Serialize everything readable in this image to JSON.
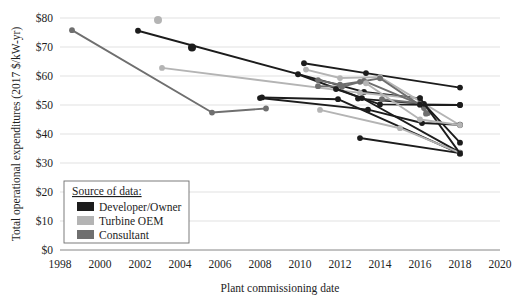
{
  "chart_data": {
    "type": "line",
    "title": "",
    "xlabel": "Plant commissioning date",
    "ylabel": "Total operational expenditures (2017 $/kW-yr)",
    "xlim": [
      1998,
      2020
    ],
    "ylim": [
      0,
      80
    ],
    "xticks": [
      "1998",
      "2000",
      "2002",
      "2004",
      "2006",
      "2008",
      "2010",
      "2012",
      "2014",
      "2016",
      "2018",
      "2020"
    ],
    "xtick_values": [
      1998,
      2000,
      2002,
      2004,
      2006,
      2008,
      2010,
      2012,
      2014,
      2016,
      2018,
      2020
    ],
    "yticks": [
      "$0",
      "$10",
      "$20",
      "$30",
      "$40",
      "$50",
      "$60",
      "$70",
      "$80"
    ],
    "ytick_values": [
      0,
      10,
      20,
      30,
      40,
      50,
      60,
      70,
      80
    ],
    "grid": true,
    "legend_position": "inside-lower-left",
    "legend_title": "Source of data:",
    "legend_entries": [
      {
        "name": "Developer/Owner",
        "color": "#1c1c1c"
      },
      {
        "name": "Turbine OEM",
        "color": "#b4b4b4"
      },
      {
        "name": "Consultant",
        "color": "#6f6f6f"
      }
    ],
    "series": [
      {
        "name": "Consultant A",
        "source": "Consultant",
        "color": "#6f6f6f",
        "points": [
          [
            1998.6,
            75.8
          ],
          [
            2005.6,
            47.4
          ],
          [
            2008.3,
            48.8
          ]
        ]
      },
      {
        "name": "Developer B",
        "source": "Developer/Owner",
        "color": "#1c1c1c",
        "points": [
          [
            2001.9,
            75.6
          ],
          [
            2013.2,
            54.5
          ],
          [
            2016.0,
            52.3
          ]
        ]
      },
      {
        "name": "Turbine OEM C",
        "source": "Turbine OEM",
        "color": "#b4b4b4",
        "points": [
          [
            2002.9,
            79.3
          ]
        ]
      },
      {
        "name": "Developer D",
        "source": "Developer/Owner",
        "color": "#1c1c1c",
        "points": [
          [
            2004.6,
            69.8
          ]
        ]
      },
      {
        "name": "Turbine OEM E",
        "source": "Turbine OEM",
        "color": "#b4b4b4",
        "points": [
          [
            2003.1,
            62.8
          ],
          [
            2013.0,
            54.2
          ],
          [
            2016.0,
            52.1
          ]
        ]
      },
      {
        "name": "Developer F",
        "source": "Developer/Owner",
        "color": "#1c1c1c",
        "points": [
          [
            2009.9,
            60.6
          ],
          [
            2013.1,
            52.4
          ],
          [
            2018.0,
            33.6
          ]
        ]
      },
      {
        "name": "Developer G",
        "source": "Developer/Owner",
        "color": "#1c1c1c",
        "points": [
          [
            2008.1,
            52.6
          ],
          [
            2011.9,
            52.0
          ],
          [
            2018.0,
            33.2
          ]
        ]
      },
      {
        "name": "Developer H",
        "source": "Developer/Owner",
        "color": "#1c1c1c",
        "points": [
          [
            2010.2,
            64.4
          ],
          [
            2013.3,
            61.0
          ],
          [
            2018.0,
            56.0
          ]
        ]
      },
      {
        "name": "Turbine OEM I",
        "source": "Turbine OEM",
        "color": "#b4b4b4",
        "points": [
          [
            2010.3,
            62.2
          ],
          [
            2012.0,
            59.3
          ],
          [
            2014.0,
            59.6
          ],
          [
            2018.0,
            43.0
          ]
        ]
      },
      {
        "name": "Consultant J",
        "source": "Consultant",
        "color": "#6f6f6f",
        "points": [
          [
            2010.9,
            58.6
          ],
          [
            2012.0,
            57.0
          ],
          [
            2013.0,
            58.0
          ],
          [
            2014.0,
            59.2
          ],
          [
            2016.2,
            49.0
          ]
        ]
      },
      {
        "name": "Consultant K",
        "source": "Consultant",
        "color": "#6f6f6f",
        "points": [
          [
            2010.9,
            56.5
          ],
          [
            2012.1,
            56.3
          ],
          [
            2013.2,
            58.3
          ],
          [
            2016.0,
            50.2
          ],
          [
            2016.4,
            47.2
          ]
        ]
      },
      {
        "name": "Developer L",
        "source": "Developer/Owner",
        "color": "#1c1c1c",
        "points": [
          [
            2011.8,
            55.5
          ],
          [
            2014.0,
            50.2
          ],
          [
            2018.0,
            50.0
          ]
        ]
      },
      {
        "name": "Developer M",
        "source": "Developer/Owner",
        "color": "#1c1c1c",
        "points": [
          [
            2012.9,
            52.2
          ],
          [
            2016.2,
            50.4
          ],
          [
            2018.0,
            37.0
          ]
        ]
      },
      {
        "name": "Developer N",
        "source": "Developer/Owner",
        "color": "#1c1c1c",
        "points": [
          [
            2013.0,
            38.6
          ],
          [
            2018.0,
            33.4
          ]
        ]
      },
      {
        "name": "Turbine OEM O",
        "source": "Turbine OEM",
        "color": "#b4b4b4",
        "points": [
          [
            2011.0,
            48.3
          ],
          [
            2015.0,
            42.0
          ],
          [
            2018.0,
            33.5
          ]
        ]
      },
      {
        "name": "Developer P",
        "source": "Developer/Owner",
        "color": "#1c1c1c",
        "points": [
          [
            2008.0,
            52.4
          ],
          [
            2013.4,
            48.4
          ],
          [
            2016.1,
            43.8
          ],
          [
            2018.0,
            43.2
          ]
        ]
      },
      {
        "name": "Consultant Q",
        "source": "Consultant",
        "color": "#6f6f6f",
        "points": [
          [
            2014.1,
            52.0
          ],
          [
            2016.0,
            50.6
          ],
          [
            2016.3,
            47.0
          ]
        ]
      },
      {
        "name": "Developer R",
        "source": "Developer/Owner",
        "color": "#1c1c1c",
        "points": [
          [
            2016.0,
            52.4
          ],
          [
            2018.0,
            33.3
          ]
        ]
      },
      {
        "name": "Turbine OEM S",
        "source": "Turbine OEM",
        "color": "#b4b4b4",
        "points": [
          [
            2013.3,
            57.5
          ],
          [
            2016.0,
            45.0
          ],
          [
            2018.0,
            43.1
          ]
        ]
      },
      {
        "name": "Developer T",
        "source": "Developer/Owner",
        "color": "#1c1c1c",
        "points": [
          [
            2016.0,
            50.1
          ],
          [
            2018.0,
            50.0
          ]
        ]
      }
    ]
  }
}
